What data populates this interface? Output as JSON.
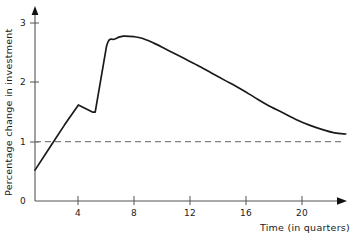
{
  "chart_data": {
    "type": "line",
    "title": "",
    "xlabel": "Time (in quarters)",
    "ylabel": "Percentage change in investment",
    "xlim": [
      0,
      23.1
    ],
    "ylim": [
      0,
      3.2
    ],
    "xticks": [
      "4",
      "8",
      "12",
      "16",
      "20"
    ],
    "xtick_values": [
      4,
      8,
      12,
      16,
      20
    ],
    "yticks": [
      "0",
      "1",
      "2",
      "3"
    ],
    "ytick_values": [
      0,
      1,
      2,
      3
    ],
    "grid": false,
    "legend": null,
    "axis_arrows": true,
    "reference_line": {
      "name": "long-run-equilibrium",
      "orientation": "horizontal",
      "value": 1,
      "style": "dashed",
      "color": "#808080",
      "label": ""
    },
    "series": [
      {
        "name": "Percentage change in investment",
        "color": "#1a1a1a",
        "style": "solid",
        "x": [
          0.9,
          2.0,
          3.0,
          4.0,
          5.0,
          5.2,
          6.0,
          6.6,
          7.2,
          8.0,
          8.6,
          9.5,
          10.5,
          11.5,
          12.5,
          13.5,
          14.5,
          15.5,
          16.5,
          17.5,
          18.5,
          19.5,
          20.5,
          21.5,
          22.3,
          23.1
        ],
        "y": [
          0.52,
          0.92,
          1.28,
          1.62,
          1.5,
          1.5,
          2.6,
          2.73,
          2.78,
          2.77,
          2.74,
          2.65,
          2.53,
          2.41,
          2.29,
          2.16,
          2.03,
          1.9,
          1.76,
          1.62,
          1.5,
          1.38,
          1.28,
          1.2,
          1.15,
          1.13
        ]
      }
    ],
    "annotations": []
  }
}
